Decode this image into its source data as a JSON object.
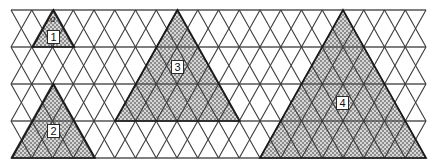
{
  "figure": {
    "background_color": "#ffffff",
    "grid": {
      "line_color": "#3a3a3a",
      "horizontal_line_color": "#555555",
      "rows": 4,
      "columns_per_row": 10,
      "left_x": 11,
      "right_x": 426,
      "top_y": 10,
      "bottom_y": 158,
      "row_height": 37,
      "half_width": 20.75,
      "grid_on": true
    },
    "shading": {
      "fill_color": "#9a9a9a",
      "pattern": "checkerboard-dither",
      "pattern_light": "#d4d4d4",
      "pattern_dark": "#6e6e6e",
      "outline_color": "#1a1a1a"
    },
    "shaded_triangles": [
      {
        "label": "1",
        "size": 1,
        "apex_x": 53.5,
        "apex_y": 10,
        "base_y": 47,
        "label_x": 47,
        "label_y": 30
      },
      {
        "label": "2",
        "size": 2,
        "apex_x": 53.5,
        "apex_y": 84,
        "base_y": 158,
        "label_x": 47,
        "label_y": 124
      },
      {
        "label": "3",
        "size": 3,
        "apex_x": 177.5,
        "apex_y": 10,
        "base_y": 121,
        "label_x": 171,
        "label_y": 60
      },
      {
        "label": "4",
        "size": 4,
        "apex_x": 343,
        "apex_y": 10,
        "base_y": 158,
        "label_x": 336,
        "label_y": 96
      }
    ],
    "side_label": {
      "text": "a",
      "x": 50,
      "y": 13
    }
  }
}
